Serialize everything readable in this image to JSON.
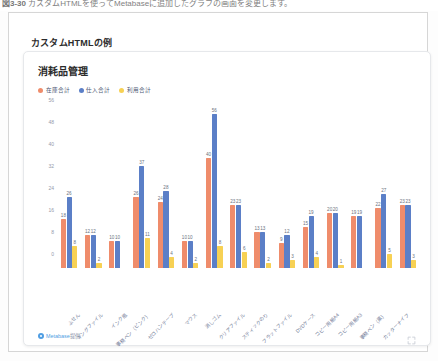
{
  "caption": {
    "prefix": "図3-30",
    "body": "カスタムHTMLを使ってMetabaseに追加したグラフの画面を変更します。"
  },
  "dashboard": {
    "title": "カスタムHTMLの例"
  },
  "card": {
    "title": "消耗品管理",
    "footer_credit": "Metabase提供",
    "footer_brand": "Metabase",
    "footer_suffix": "提供",
    "expand_icon": "expand-icon"
  },
  "legend": {
    "items": [
      {
        "label": "在庫合計",
        "color": "#ef8c6b",
        "icon": "legend-dot-icon"
      },
      {
        "label": "仕入合計",
        "color": "#5b7fc7",
        "icon": "legend-dot-icon"
      },
      {
        "label": "利用合計",
        "color": "#f7d154",
        "icon": "legend-dot-icon"
      }
    ]
  },
  "chart_data": {
    "type": "bar",
    "title": "消耗品管理",
    "xlabel": "",
    "ylabel": "",
    "ylim": [
      0,
      56
    ],
    "yticks": [
      0,
      8,
      16,
      24,
      32,
      40,
      48,
      56
    ],
    "grid": false,
    "legend_position": "top-left",
    "categories": [
      "ふせん",
      "キングファイル",
      "インク瓶",
      "事務ペン（ピンク）",
      "ゼロハンテープ",
      "マウス",
      "消しゴム",
      "クリアファイル",
      "スティックのり",
      "フラットファイル",
      "DVDケース",
      "コピー用紙A4",
      "コピー用紙A3",
      "事務ペン（黒）",
      "カッターナイフ"
    ],
    "series": [
      {
        "name": "在庫合計",
        "color": "#ef8c6b",
        "values": [
          18,
          12,
          10,
          26,
          24,
          10,
          40,
          23,
          13,
          9,
          15,
          20,
          19,
          22,
          23
        ]
      },
      {
        "name": "仕入合計",
        "color": "#5b7fc7",
        "values": [
          26,
          12,
          10,
          37,
          28,
          10,
          56,
          23,
          13,
          12,
          19,
          20,
          19,
          27,
          23
        ]
      },
      {
        "name": "利用合計",
        "color": "#f7d154",
        "values": [
          8,
          2,
          0,
          11,
          4,
          2,
          8,
          6,
          2,
          3,
          4,
          1,
          0,
          5,
          3
        ]
      }
    ]
  }
}
